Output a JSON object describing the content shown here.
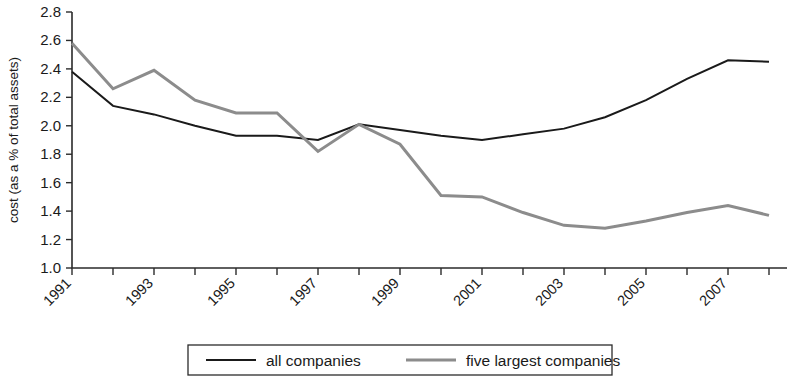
{
  "chart_data": {
    "type": "line",
    "title": "",
    "xlabel": "",
    "ylabel": "cost (as a % of total assets)",
    "x": [
      1991,
      1992,
      1993,
      1994,
      1995,
      1996,
      1997,
      1998,
      1999,
      2000,
      2001,
      2002,
      2003,
      2004,
      2005,
      2006,
      2007,
      2008
    ],
    "xlim": [
      1991,
      2008
    ],
    "ylim": [
      1.0,
      2.8
    ],
    "ytick_labels": [
      "1.0",
      "1.2",
      "1.4",
      "1.6",
      "1.8",
      "2.0",
      "2.2",
      "2.4",
      "2.6",
      "2.8"
    ],
    "ytick_values": [
      1.0,
      1.2,
      1.4,
      1.6,
      1.8,
      2.0,
      2.2,
      2.4,
      2.6,
      2.8
    ],
    "xtick_values": [
      1991,
      1992,
      1993,
      1994,
      1995,
      1996,
      1997,
      1998,
      1999,
      2000,
      2001,
      2002,
      2003,
      2004,
      2005,
      2006,
      2007,
      2008
    ],
    "xtick_labels_shown": [
      "1991",
      "1993",
      "1995",
      "1997",
      "1999",
      "2001",
      "2003",
      "2005",
      "2007"
    ],
    "xtick_label_values": [
      1991,
      1993,
      1995,
      1997,
      1999,
      2001,
      2003,
      2005,
      2007
    ],
    "xtick_label_rotation": -45,
    "grid": false,
    "legend_position": "bottom",
    "series": [
      {
        "name": "all companies",
        "color": "#1a1a1a",
        "width": 2.0,
        "values": [
          2.38,
          2.14,
          2.08,
          2.0,
          1.93,
          1.93,
          1.9,
          2.01,
          1.97,
          1.93,
          1.9,
          1.94,
          1.98,
          2.06,
          2.18,
          2.33,
          2.46,
          2.45
        ]
      },
      {
        "name": "five largest companies",
        "color": "#8c8c8c",
        "width": 3.0,
        "values": [
          2.58,
          2.26,
          2.39,
          2.18,
          2.09,
          2.09,
          1.82,
          2.01,
          1.87,
          1.51,
          1.5,
          1.39,
          1.3,
          1.28,
          1.33,
          1.39,
          1.44,
          1.37
        ]
      }
    ]
  },
  "legend": {
    "items": [
      {
        "label": "all companies",
        "color": "#1a1a1a",
        "width": 2.0
      },
      {
        "label": "five largest companies",
        "color": "#8c8c8c",
        "width": 3.0
      }
    ]
  }
}
